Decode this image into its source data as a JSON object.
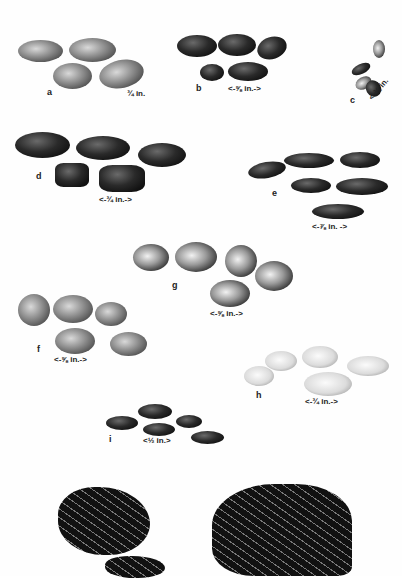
{
  "figure": {
    "groups": [
      {
        "id": "a",
        "label": "a",
        "scale": "¾ in."
      },
      {
        "id": "b",
        "label": "b",
        "scale": "<-⅝ in.->"
      },
      {
        "id": "c",
        "label": "c",
        "scale": "<-⅜ in."
      },
      {
        "id": "d",
        "label": "d",
        "scale": "<-¾ in.->"
      },
      {
        "id": "e",
        "label": "e",
        "scale": "<-⅞ in. ->"
      },
      {
        "id": "g",
        "label": "g",
        "scale": "<-⅝ in.->"
      },
      {
        "id": "f",
        "label": "f",
        "scale": "<-⅝ in.->"
      },
      {
        "id": "h",
        "label": "h",
        "scale": "<-¾ in.->"
      },
      {
        "id": "i",
        "label": "i",
        "scale": "<½ in.>"
      }
    ]
  }
}
